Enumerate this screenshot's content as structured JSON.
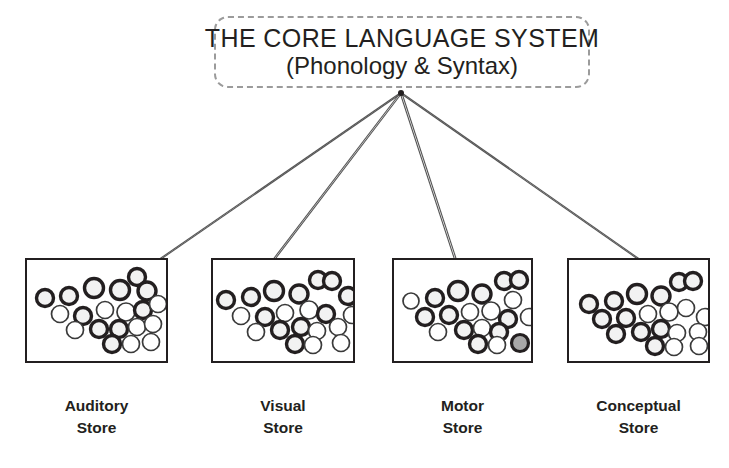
{
  "diagram": {
    "title_block": {
      "line1": "THE CORE LANGUAGE SYSTEM",
      "line2": "(Phonology & Syntax)",
      "border_style": "dashed",
      "border_color": "#9b9b9b"
    },
    "hub_point": {
      "x": 401,
      "y": 93
    },
    "colors": {
      "stroke": "#231f20",
      "circle_dark_outline": "#231f20",
      "circle_light_outline": "#3a3a3a",
      "circle_fill_light": "#f2f2f2",
      "circle_fill_highlight": "#a8a8a8",
      "line": "#555555",
      "background": "#ffffff"
    },
    "stores": [
      {
        "id": "auditory-store",
        "label_line1": "Auditory",
        "label_line2": "Store",
        "box": {
          "x": 25,
          "y": 258,
          "w": 143,
          "h": 105
        },
        "label": {
          "x": 25,
          "y": 395,
          "w": 143
        },
        "connector_target": {
          "x": 140,
          "y": 273
        },
        "nodes": [
          {
            "cx": 18,
            "cy": 38,
            "r": 8.5,
            "style": "bold"
          },
          {
            "cx": 42,
            "cy": 36,
            "r": 8.5,
            "style": "bold"
          },
          {
            "cx": 67,
            "cy": 28,
            "r": 9.5,
            "style": "bold"
          },
          {
            "cx": 93,
            "cy": 30,
            "r": 9.5,
            "style": "bold"
          },
          {
            "cx": 110,
            "cy": 17,
            "r": 8.5,
            "style": "bold"
          },
          {
            "cx": 120,
            "cy": 31,
            "r": 9.0,
            "style": "bold"
          },
          {
            "cx": 33,
            "cy": 54,
            "r": 8.5,
            "style": "light"
          },
          {
            "cx": 56,
            "cy": 56,
            "r": 8.5,
            "style": "bold"
          },
          {
            "cx": 78,
            "cy": 50,
            "r": 8.5,
            "style": "light"
          },
          {
            "cx": 99,
            "cy": 52,
            "r": 9.0,
            "style": "light"
          },
          {
            "cx": 116,
            "cy": 50,
            "r": 8.5,
            "style": "bold"
          },
          {
            "cx": 131,
            "cy": 44,
            "r": 8.5,
            "style": "light"
          },
          {
            "cx": 48,
            "cy": 70,
            "r": 8.5,
            "style": "light"
          },
          {
            "cx": 72,
            "cy": 69,
            "r": 8.5,
            "style": "bold"
          },
          {
            "cx": 92,
            "cy": 69,
            "r": 8.5,
            "style": "bold"
          },
          {
            "cx": 110,
            "cy": 67,
            "r": 8.5,
            "style": "light"
          },
          {
            "cx": 126,
            "cy": 64,
            "r": 8.5,
            "style": "light"
          },
          {
            "cx": 85,
            "cy": 84,
            "r": 8.5,
            "style": "bold"
          },
          {
            "cx": 104,
            "cy": 84,
            "r": 8.5,
            "style": "light"
          },
          {
            "cx": 124,
            "cy": 82,
            "r": 8.5,
            "style": "light"
          }
        ]
      },
      {
        "id": "visual-store",
        "label_line1": "Visual",
        "label_line2": "Store",
        "box": {
          "x": 211,
          "y": 258,
          "w": 144,
          "h": 105
        },
        "label": {
          "x": 211,
          "y": 395,
          "w": 144
        },
        "connector_target": {
          "x": 272,
          "y": 262
        },
        "nodes": [
          {
            "cx": 13,
            "cy": 40,
            "r": 8.5,
            "style": "bold"
          },
          {
            "cx": 38,
            "cy": 37,
            "r": 8.5,
            "style": "bold"
          },
          {
            "cx": 61,
            "cy": 31,
            "r": 9.5,
            "style": "bold"
          },
          {
            "cx": 86,
            "cy": 34,
            "r": 9.0,
            "style": "bold"
          },
          {
            "cx": 105,
            "cy": 20,
            "r": 8.5,
            "style": "bold"
          },
          {
            "cx": 119,
            "cy": 21,
            "r": 8.5,
            "style": "bold"
          },
          {
            "cx": 135,
            "cy": 36,
            "r": 8.5,
            "style": "bold"
          },
          {
            "cx": 28,
            "cy": 56,
            "r": 8.5,
            "style": "light"
          },
          {
            "cx": 52,
            "cy": 57,
            "r": 8.5,
            "style": "bold"
          },
          {
            "cx": 72,
            "cy": 53,
            "r": 8.5,
            "style": "light"
          },
          {
            "cx": 96,
            "cy": 50,
            "r": 9.0,
            "style": "light"
          },
          {
            "cx": 113,
            "cy": 54,
            "r": 8.5,
            "style": "bold"
          },
          {
            "cx": 139,
            "cy": 55,
            "r": 8.5,
            "style": "light"
          },
          {
            "cx": 43,
            "cy": 72,
            "r": 8.5,
            "style": "light"
          },
          {
            "cx": 67,
            "cy": 70,
            "r": 8.5,
            "style": "bold"
          },
          {
            "cx": 88,
            "cy": 67,
            "r": 8.5,
            "style": "bold"
          },
          {
            "cx": 104,
            "cy": 71,
            "r": 8.5,
            "style": "light"
          },
          {
            "cx": 125,
            "cy": 67,
            "r": 8.5,
            "style": "light"
          },
          {
            "cx": 82,
            "cy": 84,
            "r": 8.5,
            "style": "bold"
          },
          {
            "cx": 100,
            "cy": 85,
            "r": 8.5,
            "style": "light"
          },
          {
            "cx": 128,
            "cy": 83,
            "r": 8.5,
            "style": "light"
          }
        ]
      },
      {
        "id": "motor-store",
        "label_line1": "Motor",
        "label_line2": "Store",
        "box": {
          "x": 392,
          "y": 258,
          "w": 141,
          "h": 105
        },
        "label": {
          "x": 392,
          "y": 395,
          "w": 141
        },
        "connector_target": {
          "x": 455,
          "y": 258
        },
        "nodes": [
          {
            "cx": 17,
            "cy": 41,
            "r": 8.0,
            "style": "light"
          },
          {
            "cx": 41,
            "cy": 38,
            "r": 8.5,
            "style": "bold"
          },
          {
            "cx": 64,
            "cy": 31,
            "r": 9.5,
            "style": "bold"
          },
          {
            "cx": 88,
            "cy": 34,
            "r": 9.0,
            "style": "bold"
          },
          {
            "cx": 110,
            "cy": 21,
            "r": 8.5,
            "style": "bold"
          },
          {
            "cx": 125,
            "cy": 20,
            "r": 8.5,
            "style": "bold"
          },
          {
            "cx": 119,
            "cy": 40,
            "r": 8.5,
            "style": "light"
          },
          {
            "cx": 31,
            "cy": 57,
            "r": 8.5,
            "style": "bold"
          },
          {
            "cx": 55,
            "cy": 55,
            "r": 8.5,
            "style": "bold"
          },
          {
            "cx": 76,
            "cy": 52,
            "r": 8.5,
            "style": "light"
          },
          {
            "cx": 97,
            "cy": 51,
            "r": 9.0,
            "style": "light"
          },
          {
            "cx": 114,
            "cy": 59,
            "r": 8.5,
            "style": "bold"
          },
          {
            "cx": 135,
            "cy": 57,
            "r": 8.5,
            "style": "light"
          },
          {
            "cx": 44,
            "cy": 72,
            "r": 8.5,
            "style": "light"
          },
          {
            "cx": 70,
            "cy": 70,
            "r": 8.5,
            "style": "bold"
          },
          {
            "cx": 88,
            "cy": 68,
            "r": 8.5,
            "style": "light"
          },
          {
            "cx": 105,
            "cy": 72,
            "r": 8.5,
            "style": "bold"
          },
          {
            "cx": 84,
            "cy": 84,
            "r": 8.5,
            "style": "bold"
          },
          {
            "cx": 103,
            "cy": 85,
            "r": 8.5,
            "style": "light"
          },
          {
            "cx": 126,
            "cy": 83,
            "r": 8.5,
            "style": "highlight"
          }
        ]
      },
      {
        "id": "conceptual-store",
        "label_line1": "Conceptual",
        "label_line2": "Store",
        "box": {
          "x": 567,
          "y": 258,
          "w": 143,
          "h": 105
        },
        "label": {
          "x": 567,
          "y": 395,
          "w": 143
        },
        "connector_target": {
          "x": 640,
          "y": 260
        },
        "nodes": [
          {
            "cx": 20,
            "cy": 44,
            "r": 8.5,
            "style": "bold"
          },
          {
            "cx": 45,
            "cy": 41,
            "r": 8.5,
            "style": "bold"
          },
          {
            "cx": 68,
            "cy": 34,
            "r": 9.5,
            "style": "bold"
          },
          {
            "cx": 92,
            "cy": 36,
            "r": 9.0,
            "style": "bold"
          },
          {
            "cx": 110,
            "cy": 22,
            "r": 8.5,
            "style": "bold"
          },
          {
            "cx": 124,
            "cy": 21,
            "r": 8.5,
            "style": "bold"
          },
          {
            "cx": 33,
            "cy": 59,
            "r": 8.5,
            "style": "bold"
          },
          {
            "cx": 57,
            "cy": 58,
            "r": 8.5,
            "style": "bold"
          },
          {
            "cx": 79,
            "cy": 54,
            "r": 8.5,
            "style": "light"
          },
          {
            "cx": 100,
            "cy": 52,
            "r": 9.0,
            "style": "light"
          },
          {
            "cx": 117,
            "cy": 48,
            "r": 8.5,
            "style": "light"
          },
          {
            "cx": 136,
            "cy": 57,
            "r": 8.5,
            "style": "light"
          },
          {
            "cx": 47,
            "cy": 74,
            "r": 8.5,
            "style": "bold"
          },
          {
            "cx": 72,
            "cy": 72,
            "r": 8.5,
            "style": "bold"
          },
          {
            "cx": 92,
            "cy": 69,
            "r": 8.5,
            "style": "bold"
          },
          {
            "cx": 108,
            "cy": 73,
            "r": 8.5,
            "style": "light"
          },
          {
            "cx": 129,
            "cy": 72,
            "r": 8.5,
            "style": "light"
          },
          {
            "cx": 86,
            "cy": 86,
            "r": 8.5,
            "style": "bold"
          },
          {
            "cx": 105,
            "cy": 87,
            "r": 8.5,
            "style": "light"
          },
          {
            "cx": 130,
            "cy": 86,
            "r": 8.5,
            "style": "light"
          }
        ]
      }
    ]
  }
}
